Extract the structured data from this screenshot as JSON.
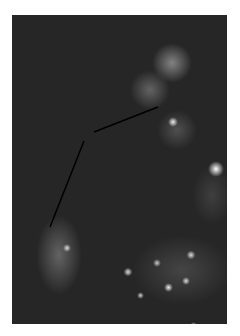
{
  "image": {
    "kind": "fluorescence-micrograph",
    "background_color": "#262626",
    "annotation_color": "#000000"
  },
  "annotations": {
    "lines": [
      {
        "x1": 158,
        "y1": 107,
        "x2": 94,
        "y2": 132
      },
      {
        "x1": 84,
        "y1": 141,
        "x2": 50,
        "y2": 227
      }
    ]
  }
}
